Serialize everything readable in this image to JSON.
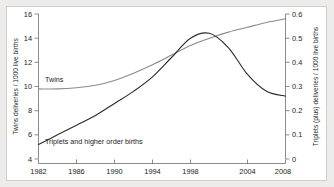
{
  "chart_data": {
    "type": "line",
    "title": "",
    "xlabel": "",
    "ylabel": "Twins deliveries / 1000 live births",
    "y2label": "Triplets (plus) deliveries / 1000 live births",
    "xlim": [
      1982,
      2008
    ],
    "ylim": [
      4,
      16
    ],
    "y2lim": [
      0,
      0.6
    ],
    "grid": false,
    "legend": "inline-annotations",
    "xticks": [
      1982,
      1986,
      1990,
      1994,
      1998,
      2004,
      2008
    ],
    "xtick_labels": [
      "1982",
      "1986",
      "1990",
      "1994",
      "1998",
      "2004",
      "2008"
    ],
    "yticks": [
      4,
      6,
      8,
      10,
      12,
      14,
      16
    ],
    "ytick_labels": [
      "4",
      "6",
      "8",
      "10",
      "12",
      "14",
      "16"
    ],
    "y2ticks": [
      0,
      0.1,
      0.2,
      0.3,
      0.4,
      0.5,
      0.6
    ],
    "y2tick_labels": [
      "0",
      "0.1",
      "0.2",
      "0.3",
      "0.4",
      "0.5",
      "0.6"
    ],
    "x": [
      1982,
      1984,
      1986,
      1988,
      1990,
      1992,
      1994,
      1996,
      1998,
      2000,
      2002,
      2004,
      2006,
      2008
    ],
    "series": [
      {
        "name": "Twins",
        "axis": "left",
        "color": "#8a8a8a",
        "label_text": "Twins",
        "values": [
          9.8,
          9.8,
          9.9,
          10.1,
          10.5,
          11.1,
          11.8,
          12.6,
          13.4,
          14.0,
          14.5,
          14.9,
          15.3,
          15.6
        ]
      },
      {
        "name": "Triplets and higher order births",
        "axis": "right",
        "color": "#2a2a2a",
        "label_text": "Triplets and higher order births",
        "values": [
          0.06,
          0.1,
          0.14,
          0.18,
          0.23,
          0.28,
          0.34,
          0.42,
          0.5,
          0.52,
          0.46,
          0.35,
          0.28,
          0.26
        ]
      }
    ],
    "annotations": [
      {
        "text": "Twins",
        "x_px": 38,
        "y_px": 72
      },
      {
        "text": "Triplets and higher order births",
        "x_px": 38,
        "y_px": 134
      }
    ]
  }
}
